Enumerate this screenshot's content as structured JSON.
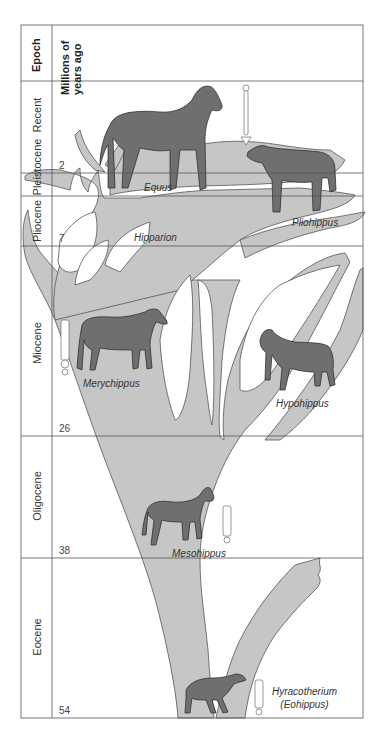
{
  "header": {
    "epoch_label": "Epoch",
    "mya_label_line1": "Millions of",
    "mya_label_line2": "years ago"
  },
  "epochs": [
    {
      "name": "Recent"
    },
    {
      "name": "Pleistocene"
    },
    {
      "name": "Pliocene"
    },
    {
      "name": "Miocene"
    },
    {
      "name": "Oligocene"
    },
    {
      "name": "Eocene"
    }
  ],
  "boundaries_mya": [
    "2",
    "7",
    "26",
    "38",
    "54"
  ],
  "taxa": {
    "equus": "Equus",
    "pliohippus": "Pliohippus",
    "hipparion": "Hipparion",
    "merychippus": "Merychippus",
    "hypohippus": "Hypohippus",
    "mesohippus": "Mesohippus",
    "hyracotherium_line1": "Hyracotherium",
    "hyracotherium_line2": "(Eohippus)"
  },
  "colors": {
    "tree_fill": "#c6c6c6",
    "horse_fill": "#6f6f6f",
    "grid_line": "#555555"
  }
}
